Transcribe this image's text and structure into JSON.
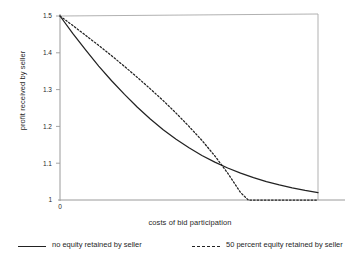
{
  "chart_data": {
    "type": "line",
    "title": "",
    "xlabel": "costs of bid participation",
    "ylabel": "profit received by seller",
    "xlim": [
      0,
      1.0
    ],
    "ylim": [
      1.0,
      1.5
    ],
    "grid": false,
    "legend_position": "below-plot",
    "x_ticks": [
      "0"
    ],
    "x_tick_values": [
      0
    ],
    "y_ticks": [
      "1",
      "1.1",
      "1.2",
      "1.3",
      "1.4",
      "1.5"
    ],
    "y_tick_values": [
      1,
      1.1,
      1.2,
      1.3,
      1.4,
      1.5
    ],
    "series": [
      {
        "name": "no equity retained by seller",
        "style": "solid",
        "color": "#222222",
        "x": [
          0.0,
          0.05,
          0.1,
          0.15,
          0.2,
          0.25,
          0.3,
          0.35,
          0.4,
          0.45,
          0.5,
          0.55,
          0.6,
          0.65,
          0.7,
          0.75,
          0.8,
          0.85,
          0.9,
          0.95,
          1.0
        ],
        "values": [
          1.5,
          1.452,
          1.407,
          1.364,
          1.324,
          1.287,
          1.252,
          1.22,
          1.191,
          1.165,
          1.142,
          1.121,
          1.103,
          1.087,
          1.073,
          1.061,
          1.05,
          1.041,
          1.033,
          1.026,
          1.02
        ]
      },
      {
        "name": "50 percent equity retained by seller",
        "style": "dashed",
        "color": "#222222",
        "x": [
          0.0,
          0.05,
          0.1,
          0.15,
          0.2,
          0.25,
          0.3,
          0.35,
          0.4,
          0.45,
          0.5,
          0.55,
          0.6,
          0.65,
          0.7,
          0.73,
          0.75,
          0.8,
          0.85,
          0.9,
          0.95,
          1.0
        ],
        "values": [
          1.5,
          1.474,
          1.447,
          1.42,
          1.392,
          1.363,
          1.333,
          1.302,
          1.27,
          1.236,
          1.2,
          1.162,
          1.12,
          1.073,
          1.02,
          1.0,
          1.0,
          1.0,
          1.0,
          1.0,
          1.0,
          1.0
        ]
      }
    ],
    "annotations": {
      "crossing_point": {
        "x": 0.52,
        "y": 1.13
      }
    }
  },
  "legend": {
    "entries": [
      {
        "label": "no equity retained by seller",
        "style": "solid"
      },
      {
        "label": "50 percent equity retained by seller",
        "style": "dashed"
      }
    ]
  },
  "axes": {
    "ylabel": "profit received by seller",
    "xlabel": "costs of bid participation",
    "y_tick_1_5": "1.5",
    "y_tick_1_4": "1.4",
    "y_tick_1_3": "1.3",
    "y_tick_1_2": "1.2",
    "y_tick_1_1": "1.1",
    "y_tick_1": "1",
    "x_tick_0": "0"
  },
  "colors": {
    "line": "#222222",
    "frame": "#9a9a9a",
    "text": "#1f1f1f",
    "background": "#ffffff"
  }
}
